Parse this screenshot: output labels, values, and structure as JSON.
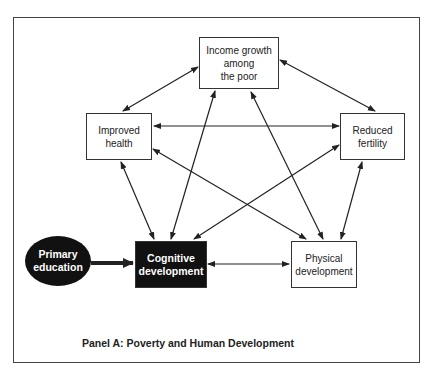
{
  "diagram": {
    "caption": "Panel A: Poverty and Human Development",
    "nodes": {
      "income": "Income growth\namong\nthe poor",
      "health": "Improved\nhealth",
      "fertility": "Reduced\nfertility",
      "education": "Primary\neducation",
      "cognitive": "Cognitive\ndevelopment",
      "physical": "Physical\ndevelopment"
    },
    "edges": [
      {
        "from": "income",
        "to": "health",
        "type": "bidirectional"
      },
      {
        "from": "income",
        "to": "fertility",
        "type": "bidirectional"
      },
      {
        "from": "health",
        "to": "fertility",
        "type": "bidirectional"
      },
      {
        "from": "health",
        "to": "cognitive",
        "type": "bidirectional"
      },
      {
        "from": "health",
        "to": "physical",
        "type": "bidirectional"
      },
      {
        "from": "income",
        "to": "cognitive",
        "type": "bidirectional"
      },
      {
        "from": "income",
        "to": "physical",
        "type": "bidirectional"
      },
      {
        "from": "fertility",
        "to": "cognitive",
        "type": "bidirectional"
      },
      {
        "from": "fertility",
        "to": "physical",
        "type": "bidirectional"
      },
      {
        "from": "cognitive",
        "to": "physical",
        "type": "bidirectional"
      },
      {
        "from": "education",
        "to": "cognitive",
        "type": "directed-bold"
      }
    ]
  }
}
